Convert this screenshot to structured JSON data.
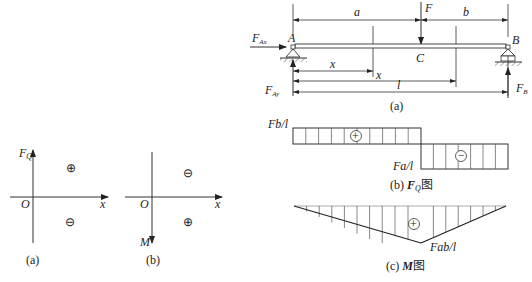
{
  "sign_convention": {
    "shear": {
      "axis_vertical": "F",
      "axis_vertical_sub": "Q",
      "axis_horizontal": "x",
      "origin": "O",
      "upper_sign": "⊕",
      "lower_sign": "⊖",
      "caption": "(a)"
    },
    "moment": {
      "axis_vertical": "M",
      "axis_horizontal": "x",
      "origin": "O",
      "upper_sign": "⊖",
      "lower_sign": "⊕",
      "caption": "(b)"
    }
  },
  "beam": {
    "support_left": "A",
    "support_right": "B",
    "load_point": "C",
    "load": "F",
    "reaction_ax": "F",
    "reaction_ax_sub": "Ax",
    "reaction_ay": "F",
    "reaction_ay_sub": "Ay",
    "reaction_b": "F",
    "reaction_b_sub": "B",
    "dim_a": "a",
    "dim_b": "b",
    "dim_x1": "x",
    "dim_x2": "x",
    "dim_l": "l",
    "caption": "(a)"
  },
  "shear_diagram": {
    "top_value": "Fb/l",
    "bottom_value": "Fa/l",
    "positive_sign": "⊕",
    "negative_sign": "⊖",
    "caption_prefix": "(b) ",
    "caption_symbol": "F",
    "caption_sub": "Q",
    "caption_suffix": "图"
  },
  "moment_diagram": {
    "peak_value": "Fab/l",
    "positive_sign": "⊕",
    "caption_prefix": "(c) ",
    "caption_symbol": "M",
    "caption_suffix": "图"
  }
}
